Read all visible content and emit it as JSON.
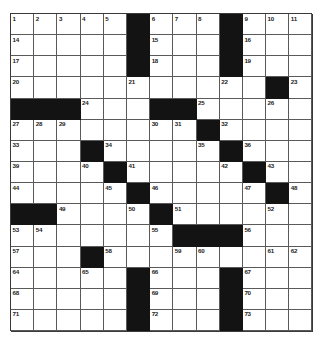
{
  "puzzle": {
    "type": "crossword-grid",
    "columns": 13,
    "rows": 15,
    "colors": {
      "block": "#131313",
      "open": "#ffffff",
      "grid_line": "#5a5a5a",
      "border": "#3a3a3a",
      "number_text": "#1a1a1a",
      "page_background": "#ffffff"
    },
    "grid": [
      [
        {
          "block": false,
          "number": "1"
        },
        {
          "block": false,
          "number": "2"
        },
        {
          "block": false,
          "number": "3"
        },
        {
          "block": false,
          "number": "4"
        },
        {
          "block": false,
          "number": "5"
        },
        {
          "block": true,
          "number": ""
        },
        {
          "block": false,
          "number": "6"
        },
        {
          "block": false,
          "number": "7"
        },
        {
          "block": false,
          "number": "8"
        },
        {
          "block": true,
          "number": ""
        },
        {
          "block": false,
          "number": "9"
        },
        {
          "block": false,
          "number": "10"
        },
        {
          "block": false,
          "number": "11"
        },
        {
          "block": false,
          "number": "12"
        },
        {
          "block": false,
          "number": "13"
        }
      ],
      [
        {
          "block": false,
          "number": "14"
        },
        {
          "block": false,
          "number": ""
        },
        {
          "block": false,
          "number": ""
        },
        {
          "block": false,
          "number": ""
        },
        {
          "block": false,
          "number": ""
        },
        {
          "block": true,
          "number": ""
        },
        {
          "block": false,
          "number": "15"
        },
        {
          "block": false,
          "number": ""
        },
        {
          "block": false,
          "number": ""
        },
        {
          "block": true,
          "number": ""
        },
        {
          "block": false,
          "number": "16"
        },
        {
          "block": false,
          "number": ""
        },
        {
          "block": false,
          "number": ""
        },
        {
          "block": false,
          "number": ""
        },
        {
          "block": false,
          "number": ""
        }
      ],
      [
        {
          "block": false,
          "number": "17"
        },
        {
          "block": false,
          "number": ""
        },
        {
          "block": false,
          "number": ""
        },
        {
          "block": false,
          "number": ""
        },
        {
          "block": false,
          "number": ""
        },
        {
          "block": true,
          "number": ""
        },
        {
          "block": false,
          "number": "18"
        },
        {
          "block": false,
          "number": ""
        },
        {
          "block": false,
          "number": ""
        },
        {
          "block": true,
          "number": ""
        },
        {
          "block": false,
          "number": "19"
        },
        {
          "block": false,
          "number": ""
        },
        {
          "block": false,
          "number": ""
        },
        {
          "block": false,
          "number": ""
        },
        {
          "block": false,
          "number": ""
        }
      ],
      [
        {
          "block": false,
          "number": "20"
        },
        {
          "block": false,
          "number": ""
        },
        {
          "block": false,
          "number": ""
        },
        {
          "block": false,
          "number": ""
        },
        {
          "block": false,
          "number": ""
        },
        {
          "block": false,
          "number": "21"
        },
        {
          "block": false,
          "number": ""
        },
        {
          "block": false,
          "number": ""
        },
        {
          "block": false,
          "number": ""
        },
        {
          "block": false,
          "number": "22"
        },
        {
          "block": false,
          "number": ""
        },
        {
          "block": true,
          "number": ""
        },
        {
          "block": false,
          "number": "23"
        },
        {
          "block": false,
          "number": ""
        },
        {
          "block": false,
          "number": ""
        }
      ],
      [
        {
          "block": true,
          "number": ""
        },
        {
          "block": true,
          "number": ""
        },
        {
          "block": true,
          "number": ""
        },
        {
          "block": false,
          "number": "24"
        },
        {
          "block": false,
          "number": ""
        },
        {
          "block": false,
          "number": ""
        },
        {
          "block": true,
          "number": ""
        },
        {
          "block": true,
          "number": ""
        },
        {
          "block": false,
          "number": "25"
        },
        {
          "block": false,
          "number": ""
        },
        {
          "block": false,
          "number": ""
        },
        {
          "block": false,
          "number": "26"
        },
        {
          "block": false,
          "number": ""
        },
        {
          "block": false,
          "number": ""
        },
        {
          "block": false,
          "number": ""
        }
      ],
      [
        {
          "block": false,
          "number": "27"
        },
        {
          "block": false,
          "number": "28"
        },
        {
          "block": false,
          "number": "29"
        },
        {
          "block": false,
          "number": ""
        },
        {
          "block": false,
          "number": ""
        },
        {
          "block": false,
          "number": ""
        },
        {
          "block": false,
          "number": "30"
        },
        {
          "block": false,
          "number": "31"
        },
        {
          "block": true,
          "number": ""
        },
        {
          "block": false,
          "number": "32"
        },
        {
          "block": false,
          "number": ""
        },
        {
          "block": false,
          "number": ""
        },
        {
          "block": false,
          "number": ""
        },
        {
          "block": true,
          "number": ""
        },
        {
          "block": true,
          "number": ""
        }
      ],
      [
        {
          "block": false,
          "number": "33"
        },
        {
          "block": false,
          "number": ""
        },
        {
          "block": false,
          "number": ""
        },
        {
          "block": true,
          "number": ""
        },
        {
          "block": false,
          "number": "34"
        },
        {
          "block": false,
          "number": ""
        },
        {
          "block": false,
          "number": ""
        },
        {
          "block": false,
          "number": ""
        },
        {
          "block": false,
          "number": "35"
        },
        {
          "block": true,
          "number": ""
        },
        {
          "block": false,
          "number": "36"
        },
        {
          "block": false,
          "number": ""
        },
        {
          "block": false,
          "number": ""
        },
        {
          "block": false,
          "number": "37"
        },
        {
          "block": false,
          "number": "38"
        }
      ],
      [
        {
          "block": false,
          "number": "39"
        },
        {
          "block": false,
          "number": ""
        },
        {
          "block": false,
          "number": ""
        },
        {
          "block": false,
          "number": "40"
        },
        {
          "block": true,
          "number": ""
        },
        {
          "block": false,
          "number": "41"
        },
        {
          "block": false,
          "number": ""
        },
        {
          "block": false,
          "number": ""
        },
        {
          "block": false,
          "number": ""
        },
        {
          "block": false,
          "number": "42"
        },
        {
          "block": true,
          "number": ""
        },
        {
          "block": false,
          "number": "43"
        },
        {
          "block": false,
          "number": ""
        },
        {
          "block": false,
          "number": ""
        },
        {
          "block": false,
          "number": ""
        }
      ],
      [
        {
          "block": false,
          "number": "44"
        },
        {
          "block": false,
          "number": ""
        },
        {
          "block": false,
          "number": ""
        },
        {
          "block": false,
          "number": ""
        },
        {
          "block": false,
          "number": "45"
        },
        {
          "block": true,
          "number": ""
        },
        {
          "block": false,
          "number": "46"
        },
        {
          "block": false,
          "number": ""
        },
        {
          "block": false,
          "number": ""
        },
        {
          "block": false,
          "number": ""
        },
        {
          "block": false,
          "number": "47"
        },
        {
          "block": true,
          "number": ""
        },
        {
          "block": false,
          "number": "48"
        },
        {
          "block": false,
          "number": ""
        },
        {
          "block": false,
          "number": ""
        }
      ],
      [
        {
          "block": true,
          "number": ""
        },
        {
          "block": true,
          "number": ""
        },
        {
          "block": false,
          "number": "49"
        },
        {
          "block": false,
          "number": ""
        },
        {
          "block": false,
          "number": ""
        },
        {
          "block": false,
          "number": "50"
        },
        {
          "block": true,
          "number": ""
        },
        {
          "block": false,
          "number": "51"
        },
        {
          "block": false,
          "number": ""
        },
        {
          "block": false,
          "number": ""
        },
        {
          "block": false,
          "number": ""
        },
        {
          "block": false,
          "number": "52"
        },
        {
          "block": false,
          "number": ""
        },
        {
          "block": false,
          "number": ""
        },
        {
          "block": false,
          "number": ""
        }
      ],
      [
        {
          "block": false,
          "number": "53"
        },
        {
          "block": false,
          "number": "54"
        },
        {
          "block": false,
          "number": ""
        },
        {
          "block": false,
          "number": ""
        },
        {
          "block": false,
          "number": ""
        },
        {
          "block": false,
          "number": ""
        },
        {
          "block": false,
          "number": "55"
        },
        {
          "block": true,
          "number": ""
        },
        {
          "block": true,
          "number": ""
        },
        {
          "block": true,
          "number": ""
        },
        {
          "block": false,
          "number": "56"
        },
        {
          "block": false,
          "number": ""
        },
        {
          "block": false,
          "number": ""
        },
        {
          "block": true,
          "number": ""
        },
        {
          "block": true,
          "number": ""
        }
      ],
      [
        {
          "block": false,
          "number": "57"
        },
        {
          "block": false,
          "number": ""
        },
        {
          "block": false,
          "number": ""
        },
        {
          "block": true,
          "number": ""
        },
        {
          "block": false,
          "number": "58"
        },
        {
          "block": false,
          "number": ""
        },
        {
          "block": false,
          "number": ""
        },
        {
          "block": false,
          "number": "59"
        },
        {
          "block": false,
          "number": "60"
        },
        {
          "block": false,
          "number": ""
        },
        {
          "block": false,
          "number": ""
        },
        {
          "block": false,
          "number": "61"
        },
        {
          "block": false,
          "number": "62"
        },
        {
          "block": false,
          "number": "63"
        },
        {
          "block": false,
          "number": ""
        }
      ],
      [
        {
          "block": false,
          "number": "64"
        },
        {
          "block": false,
          "number": ""
        },
        {
          "block": false,
          "number": ""
        },
        {
          "block": false,
          "number": "65"
        },
        {
          "block": false,
          "number": ""
        },
        {
          "block": true,
          "number": ""
        },
        {
          "block": false,
          "number": "66"
        },
        {
          "block": false,
          "number": ""
        },
        {
          "block": false,
          "number": ""
        },
        {
          "block": true,
          "number": ""
        },
        {
          "block": false,
          "number": "67"
        },
        {
          "block": false,
          "number": ""
        },
        {
          "block": false,
          "number": ""
        },
        {
          "block": false,
          "number": ""
        },
        {
          "block": false,
          "number": ""
        }
      ],
      [
        {
          "block": false,
          "number": "68"
        },
        {
          "block": false,
          "number": ""
        },
        {
          "block": false,
          "number": ""
        },
        {
          "block": false,
          "number": ""
        },
        {
          "block": false,
          "number": ""
        },
        {
          "block": true,
          "number": ""
        },
        {
          "block": false,
          "number": "69"
        },
        {
          "block": false,
          "number": ""
        },
        {
          "block": false,
          "number": ""
        },
        {
          "block": true,
          "number": ""
        },
        {
          "block": false,
          "number": "70"
        },
        {
          "block": false,
          "number": ""
        },
        {
          "block": false,
          "number": ""
        },
        {
          "block": false,
          "number": ""
        },
        {
          "block": false,
          "number": ""
        }
      ],
      [
        {
          "block": false,
          "number": "71"
        },
        {
          "block": false,
          "number": ""
        },
        {
          "block": false,
          "number": ""
        },
        {
          "block": false,
          "number": ""
        },
        {
          "block": false,
          "number": ""
        },
        {
          "block": true,
          "number": ""
        },
        {
          "block": false,
          "number": "72"
        },
        {
          "block": false,
          "number": ""
        },
        {
          "block": false,
          "number": ""
        },
        {
          "block": true,
          "number": ""
        },
        {
          "block": false,
          "number": "73"
        },
        {
          "block": false,
          "number": ""
        },
        {
          "block": false,
          "number": ""
        },
        {
          "block": false,
          "number": ""
        },
        {
          "block": false,
          "number": ""
        }
      ]
    ]
  }
}
